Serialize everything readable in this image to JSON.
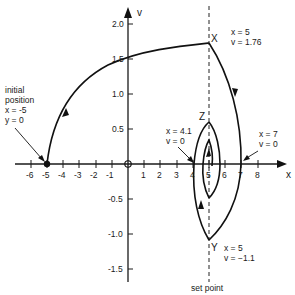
{
  "diagram": {
    "axes": {
      "x_label": "x",
      "y_label": "v",
      "x_ticks": [
        "-6",
        "-5",
        "-4",
        "-3",
        "-2",
        "-1",
        "1",
        "2",
        "3",
        "4",
        "5",
        "6",
        "7",
        "8"
      ],
      "y_ticks": [
        "2.0",
        "1.5",
        "1.0",
        "0.5",
        "-0.5",
        "-1.0",
        "-1.5"
      ]
    },
    "annotations": {
      "initial": {
        "line1": "initial",
        "line2": "position",
        "line3": "x = -5",
        "line4": "y = 0"
      },
      "X": {
        "label": "X",
        "line1": "x = 5",
        "line2": "v = 1.76"
      },
      "Z": {
        "label": "Z"
      },
      "left_cross": {
        "line1": "x = 4.1",
        "line2": "v = 0"
      },
      "right_cross": {
        "line1": "x = 7",
        "line2": "v = 0"
      },
      "Y": {
        "label": "Y",
        "line1": "x = 5",
        "line2": "v = −1.1"
      },
      "set_point": "set point"
    }
  }
}
